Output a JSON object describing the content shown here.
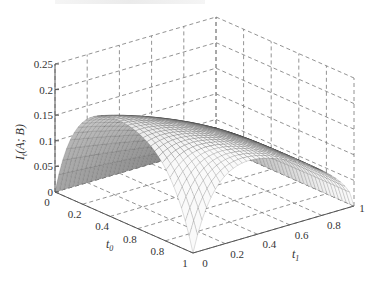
{
  "chart_data": {
    "type": "surface3d",
    "title": "",
    "xlabel": "t0",
    "ylabel": "t1",
    "zlabel": "I_t(A; B)",
    "x_ticks": [
      "0",
      "0.2",
      "0.4",
      "0.8",
      "0.8",
      "1"
    ],
    "y_ticks": [
      "0",
      "0.2",
      "0.4",
      "0.6",
      "0.8",
      "1"
    ],
    "z_ticks": [
      "0",
      "0.05",
      "0.1",
      "0.15",
      "0.2",
      "0.25"
    ],
    "xlim": [
      0,
      1
    ],
    "ylim": [
      0,
      1
    ],
    "zlim": [
      0,
      0.25
    ],
    "grid": true,
    "grid_style": "dashed",
    "colormap": "gray mesh",
    "sample_points": [
      {
        "t0": 0.0,
        "t1": 0.0,
        "z": 0.0
      },
      {
        "t0": 0.0,
        "t1": 0.5,
        "z": 0.0
      },
      {
        "t0": 0.0,
        "t1": 1.0,
        "z": 0.0
      },
      {
        "t0": 0.2,
        "t1": 0.2,
        "z": 0.15
      },
      {
        "t0": 0.3,
        "t1": 0.5,
        "z": 0.2
      },
      {
        "t0": 0.5,
        "t1": 0.5,
        "z": 0.19
      },
      {
        "t0": 0.5,
        "t1": 0.8,
        "z": 0.14
      },
      {
        "t0": 1.0,
        "t1": 0.0,
        "z": 0.0
      },
      {
        "t0": 1.0,
        "t1": 0.5,
        "z": 0.12
      },
      {
        "t0": 1.0,
        "t1": 1.0,
        "z": 0.0
      }
    ]
  },
  "labels": {
    "z_axis": "I",
    "z_axis_sub": "t",
    "z_axis_args": "(A; B)",
    "t0": "t",
    "t0_sub": "0",
    "t1": "t",
    "t1_sub": "1"
  }
}
